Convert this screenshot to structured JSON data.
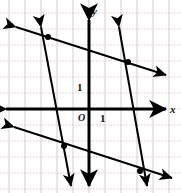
{
  "figure": {
    "kind": "coordinate-plane-graph",
    "width": 181,
    "height": 193,
    "background": "#ffffff",
    "grid": {
      "visible": true,
      "color": "#d9c9cc",
      "spacing_px": 16,
      "x_lines_px": [
        9,
        25,
        41,
        57,
        73,
        89,
        105,
        121,
        137,
        153,
        169
      ],
      "y_lines_px": [
        13,
        29,
        45,
        61,
        77,
        93,
        109,
        125,
        141,
        157,
        173,
        189
      ]
    },
    "axes": {
      "color": "#000000",
      "stroke_px": 3,
      "origin_px": {
        "x": 89,
        "y": 109
      },
      "x_axis": {
        "y_px": 109,
        "x_start_px": 6,
        "x_end_px": 166,
        "arrows": "both"
      },
      "y_axis": {
        "x_px": 89,
        "y_start_px": 20,
        "y_end_px": 186,
        "arrows": "both"
      }
    },
    "labels": {
      "x_axis": "x",
      "y_axis": "y",
      "origin": "O",
      "unit_y": "1",
      "unit_x": "1"
    },
    "label_positions_px": {
      "x_axis": {
        "x": 170,
        "y": 104
      },
      "y_axis": {
        "x": 92,
        "y": 6
      },
      "origin": {
        "x": 78,
        "y": 113
      },
      "unit_y": {
        "x": 77,
        "y": 82
      },
      "unit_x": {
        "x": 100,
        "y": 113
      }
    },
    "lines": [
      {
        "id": "steep-left",
        "name": "steep-line-left",
        "description": "near-vertical line with steep negative slope through upper-left region",
        "color": "#000000",
        "stroke_px": 2,
        "arrows": "both",
        "start_px": {
          "x": 41,
          "y": 27
        },
        "end_px": {
          "x": 71,
          "y": 186
        }
      },
      {
        "id": "steep-right",
        "name": "steep-line-right",
        "description": "near-vertical line with steep negative slope through right region",
        "color": "#000000",
        "stroke_px": 2,
        "arrows": "both",
        "start_px": {
          "x": 119,
          "y": 27
        },
        "end_px": {
          "x": 147,
          "y": 186
        }
      },
      {
        "id": "shallow-upper",
        "name": "shallow-line-upper",
        "description": "shallow negative-slope line crossing the upper half",
        "color": "#000000",
        "stroke_px": 2,
        "arrows": "both",
        "start_px": {
          "x": 16,
          "y": 27
        },
        "end_px": {
          "x": 166,
          "y": 75
        }
      },
      {
        "id": "shallow-lower",
        "name": "shallow-line-lower",
        "description": "shallow negative-slope line crossing the lower half, parallel to upper",
        "color": "#000000",
        "stroke_px": 2,
        "arrows": "both",
        "start_px": {
          "x": 14,
          "y": 127
        },
        "end_px": {
          "x": 172,
          "y": 178
        }
      }
    ],
    "points": [
      {
        "id": "p-upper-left",
        "name": "intersection-upper-left",
        "x_px": 48,
        "y_px": 37,
        "r_px": 3,
        "color": "#000000"
      },
      {
        "id": "p-upper-right",
        "name": "intersection-upper-right",
        "x_px": 128,
        "y_px": 62,
        "r_px": 3,
        "color": "#000000"
      },
      {
        "id": "p-lower-left",
        "name": "intersection-lower-left",
        "x_px": 64,
        "y_px": 146,
        "r_px": 3,
        "color": "#000000"
      },
      {
        "id": "p-lower-right",
        "name": "intersection-lower-right",
        "x_px": 140,
        "y_px": 171,
        "r_px": 3,
        "color": "#000000"
      }
    ]
  }
}
